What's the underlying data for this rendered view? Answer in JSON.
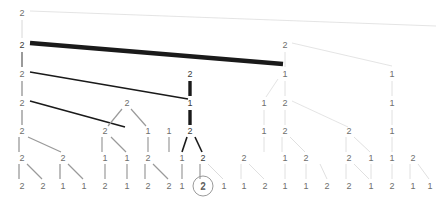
{
  "figure": {
    "type": "tree-diagram",
    "title": "",
    "width": 436,
    "height": 200,
    "background": "#ffffff",
    "levels_y": [
      13,
      45,
      74,
      103,
      131,
      158,
      186
    ],
    "colors": {
      "label_light": "#8a8a8a",
      "label_mid": "#6e6e6e",
      "label_dark": "#3a3a3a",
      "edge_light": "#d8d8d8",
      "edge_mid": "#9a9a9a",
      "edge_dark": "#1a1a1a",
      "ring": "#9a9a9a"
    }
  },
  "selection": {
    "label": "2",
    "x": 203,
    "y": 186,
    "ring_radius": 10.5
  },
  "nodes": [
    {
      "id": "n0",
      "label": "2",
      "x": 22,
      "y": 13,
      "tone": "mid"
    },
    {
      "id": "n1",
      "label": "2",
      "x": 22,
      "y": 45,
      "tone": "dark"
    },
    {
      "id": "n2",
      "label": "2",
      "x": 285,
      "y": 45,
      "tone": "mid"
    },
    {
      "id": "n3",
      "label": "2",
      "x": 22,
      "y": 74,
      "tone": "mid"
    },
    {
      "id": "n4",
      "label": "2",
      "x": 190,
      "y": 74,
      "tone": "dark"
    },
    {
      "id": "n5",
      "label": "1",
      "x": 285,
      "y": 74,
      "tone": "mid"
    },
    {
      "id": "n6",
      "label": "1",
      "x": 392,
      "y": 74,
      "tone": "mid"
    },
    {
      "id": "n7",
      "label": "2",
      "x": 22,
      "y": 103,
      "tone": "mid"
    },
    {
      "id": "n8",
      "label": "2",
      "x": 127,
      "y": 103,
      "tone": "mid"
    },
    {
      "id": "n9",
      "label": "1",
      "x": 190,
      "y": 103,
      "tone": "dark"
    },
    {
      "id": "n10",
      "label": "1",
      "x": 264,
      "y": 103,
      "tone": "mid"
    },
    {
      "id": "n11",
      "label": "2",
      "x": 285,
      "y": 103,
      "tone": "mid"
    },
    {
      "id": "n12",
      "label": "1",
      "x": 392,
      "y": 103,
      "tone": "mid"
    },
    {
      "id": "n13",
      "label": "2",
      "x": 22,
      "y": 131,
      "tone": "mid"
    },
    {
      "id": "n14",
      "label": "2",
      "x": 105,
      "y": 131,
      "tone": "mid"
    },
    {
      "id": "n15",
      "label": "1",
      "x": 148,
      "y": 131,
      "tone": "mid"
    },
    {
      "id": "n16",
      "label": "1",
      "x": 169,
      "y": 131,
      "tone": "mid"
    },
    {
      "id": "n17",
      "label": "2",
      "x": 190,
      "y": 131,
      "tone": "dark"
    },
    {
      "id": "n18",
      "label": "1",
      "x": 264,
      "y": 131,
      "tone": "mid"
    },
    {
      "id": "n19",
      "label": "2",
      "x": 285,
      "y": 131,
      "tone": "mid"
    },
    {
      "id": "n20",
      "label": "2",
      "x": 349,
      "y": 131,
      "tone": "mid"
    },
    {
      "id": "n21",
      "label": "1",
      "x": 392,
      "y": 131,
      "tone": "mid"
    },
    {
      "id": "n22",
      "label": "2",
      "x": 22,
      "y": 158,
      "tone": "mid"
    },
    {
      "id": "n23",
      "label": "2",
      "x": 63,
      "y": 158,
      "tone": "mid"
    },
    {
      "id": "n24",
      "label": "1",
      "x": 105,
      "y": 158,
      "tone": "mid"
    },
    {
      "id": "n25",
      "label": "1",
      "x": 127,
      "y": 158,
      "tone": "mid"
    },
    {
      "id": "n26",
      "label": "2",
      "x": 148,
      "y": 158,
      "tone": "mid"
    },
    {
      "id": "n27",
      "label": "1",
      "x": 182,
      "y": 158,
      "tone": "mid"
    },
    {
      "id": "n28",
      "label": "2",
      "x": 203,
      "y": 158,
      "tone": "dark"
    },
    {
      "id": "n29",
      "label": "2",
      "x": 244,
      "y": 158,
      "tone": "mid"
    },
    {
      "id": "n30",
      "label": "1",
      "x": 285,
      "y": 158,
      "tone": "mid"
    },
    {
      "id": "n31",
      "label": "2",
      "x": 306,
      "y": 158,
      "tone": "mid"
    },
    {
      "id": "n32",
      "label": "2",
      "x": 349,
      "y": 158,
      "tone": "mid"
    },
    {
      "id": "n33",
      "label": "1",
      "x": 371,
      "y": 158,
      "tone": "mid"
    },
    {
      "id": "n34",
      "label": "1",
      "x": 392,
      "y": 158,
      "tone": "mid"
    },
    {
      "id": "n35",
      "label": "2",
      "x": 413,
      "y": 158,
      "tone": "mid"
    },
    {
      "id": "l0",
      "label": "2",
      "x": 22,
      "y": 186,
      "tone": "mid"
    },
    {
      "id": "l1",
      "label": "2",
      "x": 43,
      "y": 186,
      "tone": "mid"
    },
    {
      "id": "l2",
      "label": "1",
      "x": 63,
      "y": 186,
      "tone": "mid"
    },
    {
      "id": "l3",
      "label": "1",
      "x": 84,
      "y": 186,
      "tone": "mid"
    },
    {
      "id": "l4",
      "label": "2",
      "x": 105,
      "y": 186,
      "tone": "mid"
    },
    {
      "id": "l5",
      "label": "1",
      "x": 127,
      "y": 186,
      "tone": "mid"
    },
    {
      "id": "l6",
      "label": "2",
      "x": 148,
      "y": 186,
      "tone": "mid"
    },
    {
      "id": "l7",
      "label": "2",
      "x": 169,
      "y": 186,
      "tone": "mid"
    },
    {
      "id": "l8",
      "label": "1",
      "x": 182,
      "y": 186,
      "tone": "mid"
    },
    {
      "id": "l9",
      "label": "2",
      "x": 203,
      "y": 186,
      "tone": "mid"
    },
    {
      "id": "l10",
      "label": "1",
      "x": 224,
      "y": 186,
      "tone": "mid"
    },
    {
      "id": "l11",
      "label": "1",
      "x": 244,
      "y": 186,
      "tone": "mid"
    },
    {
      "id": "l12",
      "label": "2",
      "x": 265,
      "y": 186,
      "tone": "mid"
    },
    {
      "id": "l13",
      "label": "1",
      "x": 285,
      "y": 186,
      "tone": "mid"
    },
    {
      "id": "l14",
      "label": "1",
      "x": 306,
      "y": 186,
      "tone": "mid"
    },
    {
      "id": "l15",
      "label": "2",
      "x": 327,
      "y": 186,
      "tone": "mid"
    },
    {
      "id": "l16",
      "label": "2",
      "x": 349,
      "y": 186,
      "tone": "mid"
    },
    {
      "id": "l17",
      "label": "1",
      "x": 371,
      "y": 186,
      "tone": "mid"
    },
    {
      "id": "l18",
      "label": "2",
      "x": 392,
      "y": 186,
      "tone": "mid"
    },
    {
      "id": "l19",
      "label": "1",
      "x": 413,
      "y": 186,
      "tone": "mid"
    },
    {
      "id": "l20",
      "label": "1",
      "x": 430,
      "y": 186,
      "tone": "mid"
    }
  ],
  "edges": [
    {
      "x1": 30,
      "y1": 11,
      "x2": 436,
      "y2": 26,
      "tone": "light",
      "w": 0.7
    },
    {
      "x1": 22,
      "y1": 20,
      "x2": 22,
      "y2": 38,
      "tone": "light",
      "w": 1
    },
    {
      "x1": 30,
      "y1": 43,
      "x2": 283,
      "y2": 64,
      "tone": "dark",
      "w": 4.5
    },
    {
      "x1": 22,
      "y1": 52,
      "x2": 22,
      "y2": 67,
      "tone": "mid",
      "w": 2
    },
    {
      "x1": 292,
      "y1": 43,
      "x2": 392,
      "y2": 66,
      "tone": "light",
      "w": 0.7
    },
    {
      "x1": 285,
      "y1": 52,
      "x2": 285,
      "y2": 67,
      "tone": "light",
      "w": 0.8
    },
    {
      "x1": 30,
      "y1": 72,
      "x2": 188,
      "y2": 99,
      "tone": "dark",
      "w": 1.6
    },
    {
      "x1": 22,
      "y1": 81,
      "x2": 22,
      "y2": 96,
      "tone": "mid",
      "w": 1.4
    },
    {
      "x1": 190,
      "y1": 81,
      "x2": 190,
      "y2": 96,
      "tone": "dark",
      "w": 3.4
    },
    {
      "x1": 278,
      "y1": 79,
      "x2": 266,
      "y2": 97,
      "tone": "light",
      "w": 0.7
    },
    {
      "x1": 285,
      "y1": 81,
      "x2": 285,
      "y2": 96,
      "tone": "light",
      "w": 0.8
    },
    {
      "x1": 392,
      "y1": 81,
      "x2": 392,
      "y2": 96,
      "tone": "light",
      "w": 0.8
    },
    {
      "x1": 30,
      "y1": 101,
      "x2": 125,
      "y2": 127,
      "tone": "dark",
      "w": 1.6
    },
    {
      "x1": 22,
      "y1": 110,
      "x2": 22,
      "y2": 125,
      "tone": "mid",
      "w": 1.4
    },
    {
      "x1": 122,
      "y1": 109,
      "x2": 108,
      "y2": 126,
      "tone": "mid",
      "w": 1.2
    },
    {
      "x1": 131,
      "y1": 109,
      "x2": 146,
      "y2": 126,
      "tone": "mid",
      "w": 1.2
    },
    {
      "x1": 190,
      "y1": 110,
      "x2": 190,
      "y2": 125,
      "tone": "dark",
      "w": 3.4
    },
    {
      "x1": 264,
      "y1": 110,
      "x2": 264,
      "y2": 125,
      "tone": "light",
      "w": 0.8
    },
    {
      "x1": 292,
      "y1": 101,
      "x2": 348,
      "y2": 127,
      "tone": "light",
      "w": 0.7
    },
    {
      "x1": 285,
      "y1": 110,
      "x2": 285,
      "y2": 125,
      "tone": "light",
      "w": 0.8
    },
    {
      "x1": 392,
      "y1": 110,
      "x2": 392,
      "y2": 125,
      "tone": "light",
      "w": 0.8
    },
    {
      "x1": 19,
      "y1": 137,
      "x2": 19,
      "y2": 152,
      "tone": "mid",
      "w": 1.3
    },
    {
      "x1": 28,
      "y1": 137,
      "x2": 61,
      "y2": 152,
      "tone": "mid",
      "w": 1.3
    },
    {
      "x1": 102,
      "y1": 137,
      "x2": 102,
      "y2": 152,
      "tone": "mid",
      "w": 1.2
    },
    {
      "x1": 111,
      "y1": 137,
      "x2": 126,
      "y2": 152,
      "tone": "mid",
      "w": 1.2
    },
    {
      "x1": 148,
      "y1": 137,
      "x2": 148,
      "y2": 152,
      "tone": "mid",
      "w": 1.2
    },
    {
      "x1": 169,
      "y1": 137,
      "x2": 169,
      "y2": 152,
      "tone": "mid",
      "w": 1.2
    },
    {
      "x1": 187,
      "y1": 137,
      "x2": 182,
      "y2": 152,
      "tone": "dark",
      "w": 1.6
    },
    {
      "x1": 195,
      "y1": 137,
      "x2": 202,
      "y2": 152,
      "tone": "dark",
      "w": 1.6
    },
    {
      "x1": 264,
      "y1": 137,
      "x2": 264,
      "y2": 152,
      "tone": "light",
      "w": 0.8
    },
    {
      "x1": 282,
      "y1": 137,
      "x2": 282,
      "y2": 152,
      "tone": "light",
      "w": 0.8
    },
    {
      "x1": 290,
      "y1": 137,
      "x2": 305,
      "y2": 152,
      "tone": "light",
      "w": 0.8
    },
    {
      "x1": 346,
      "y1": 137,
      "x2": 346,
      "y2": 152,
      "tone": "light",
      "w": 0.8
    },
    {
      "x1": 354,
      "y1": 137,
      "x2": 370,
      "y2": 152,
      "tone": "light",
      "w": 0.8
    },
    {
      "x1": 392,
      "y1": 137,
      "x2": 392,
      "y2": 152,
      "tone": "light",
      "w": 0.8
    },
    {
      "x1": 19,
      "y1": 164,
      "x2": 19,
      "y2": 179,
      "tone": "mid",
      "w": 1.3
    },
    {
      "x1": 27,
      "y1": 164,
      "x2": 42,
      "y2": 179,
      "tone": "mid",
      "w": 1.3
    },
    {
      "x1": 60,
      "y1": 164,
      "x2": 60,
      "y2": 179,
      "tone": "mid",
      "w": 1.3
    },
    {
      "x1": 68,
      "y1": 164,
      "x2": 83,
      "y2": 179,
      "tone": "mid",
      "w": 1.3
    },
    {
      "x1": 105,
      "y1": 164,
      "x2": 105,
      "y2": 179,
      "tone": "mid",
      "w": 1.2
    },
    {
      "x1": 127,
      "y1": 164,
      "x2": 127,
      "y2": 179,
      "tone": "mid",
      "w": 1.2
    },
    {
      "x1": 145,
      "y1": 164,
      "x2": 145,
      "y2": 179,
      "tone": "mid",
      "w": 1.2
    },
    {
      "x1": 153,
      "y1": 164,
      "x2": 168,
      "y2": 179,
      "tone": "mid",
      "w": 1.2
    },
    {
      "x1": 182,
      "y1": 164,
      "x2": 182,
      "y2": 179,
      "tone": "mid",
      "w": 1.2
    },
    {
      "x1": 200,
      "y1": 164,
      "x2": 200,
      "y2": 179,
      "tone": "mid",
      "w": 1.2
    },
    {
      "x1": 208,
      "y1": 164,
      "x2": 223,
      "y2": 179,
      "tone": "light",
      "w": 0.9
    },
    {
      "x1": 241,
      "y1": 164,
      "x2": 241,
      "y2": 179,
      "tone": "light",
      "w": 0.8
    },
    {
      "x1": 249,
      "y1": 164,
      "x2": 264,
      "y2": 179,
      "tone": "light",
      "w": 0.8
    },
    {
      "x1": 285,
      "y1": 164,
      "x2": 285,
      "y2": 179,
      "tone": "light",
      "w": 0.8
    },
    {
      "x1": 306,
      "y1": 164,
      "x2": 306,
      "y2": 179,
      "tone": "light",
      "w": 0.8
    },
    {
      "x1": 320,
      "y1": 164,
      "x2": 327,
      "y2": 179,
      "tone": "light",
      "w": 0.8
    },
    {
      "x1": 346,
      "y1": 164,
      "x2": 346,
      "y2": 179,
      "tone": "light",
      "w": 0.8
    },
    {
      "x1": 354,
      "y1": 164,
      "x2": 369,
      "y2": 179,
      "tone": "light",
      "w": 0.8
    },
    {
      "x1": 371,
      "y1": 164,
      "x2": 371,
      "y2": 179,
      "tone": "light",
      "w": 0.8
    },
    {
      "x1": 392,
      "y1": 164,
      "x2": 392,
      "y2": 179,
      "tone": "light",
      "w": 0.8
    },
    {
      "x1": 410,
      "y1": 164,
      "x2": 410,
      "y2": 179,
      "tone": "light",
      "w": 0.8
    },
    {
      "x1": 418,
      "y1": 164,
      "x2": 429,
      "y2": 179,
      "tone": "light",
      "w": 0.8
    }
  ]
}
